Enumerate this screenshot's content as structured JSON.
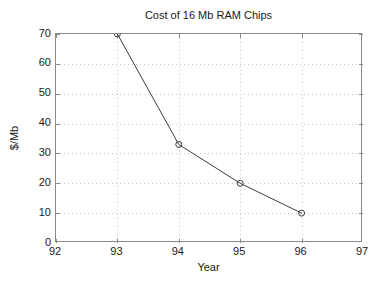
{
  "chart_data": {
    "type": "line",
    "title": "Cost of 16 Mb RAM Chips",
    "xlabel": "Year",
    "ylabel": "$/Mb",
    "x": [
      93,
      94,
      95,
      96
    ],
    "values": [
      70,
      33,
      20,
      10
    ],
    "series": [
      {
        "name": "Cost of 16 Mb RAM Chips",
        "x": [
          93,
          94,
          95,
          96
        ],
        "values": [
          70,
          33,
          20,
          10
        ]
      }
    ],
    "points": [
      {
        "x": 93,
        "y": 70
      },
      {
        "x": 94,
        "y": 33
      },
      {
        "x": 95,
        "y": 20
      },
      {
        "x": 96,
        "y": 10
      }
    ],
    "xlim": [
      92,
      97
    ],
    "ylim": [
      0,
      70
    ],
    "xticks": [
      92,
      93,
      94,
      95,
      96,
      97
    ],
    "yticks": [
      0,
      10,
      20,
      30,
      40,
      50,
      60,
      70
    ],
    "xtick_labels": [
      "92",
      "93",
      "94",
      "95",
      "96",
      "97"
    ],
    "ytick_labels": [
      "0",
      "10",
      "20",
      "30",
      "40",
      "50",
      "60",
      "70"
    ],
    "grid": true,
    "grid_style": "dotted",
    "legend": null,
    "legend_position": "none",
    "marker": "circle-open",
    "colors": {
      "line": "#3c3c3c",
      "marker": "#3c3c3c",
      "grid": "#c8c8c8",
      "axis": "#8a8a8a",
      "text": "#1a1a1a",
      "background": "#ffffff"
    }
  }
}
